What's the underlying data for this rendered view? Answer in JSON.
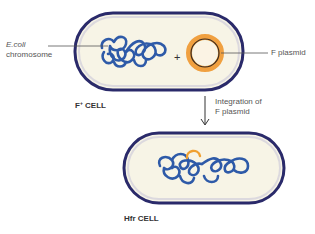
{
  "diagram": {
    "top_cell": {
      "caption_main": "F",
      "caption_sup": "+",
      "caption_rest": " CELL",
      "chromosome_label_line1": "E.coli",
      "chromosome_label_line2": "chromosome",
      "plus_sign": "+",
      "plasmid_label": "F plasmid"
    },
    "transition": {
      "label_line1": "Integration of",
      "label_line2": "F plasmid"
    },
    "bottom_cell": {
      "caption": "Hfr CELL"
    },
    "colors": {
      "cell_wall": "#2a2a6a",
      "cytoplasm": "#f7f4e6",
      "chromosome": "#2e5aa8",
      "plasmid_outer": "#f0a040",
      "plasmid_inner": "#3a2a20",
      "integrated_segment": "#f0a030"
    }
  }
}
